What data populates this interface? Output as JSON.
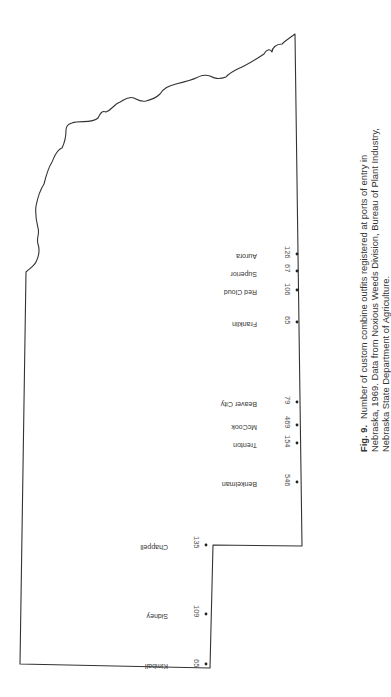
{
  "map": {
    "region": "Nebraska",
    "orientation": "rotated 90 degrees",
    "stroke_color": "#333333",
    "places": [
      {
        "name": "Aurora",
        "count": "126"
      },
      {
        "name": "Superior",
        "count": "67"
      },
      {
        "name": "Red Cloud",
        "count": "106"
      },
      {
        "name": "Franklin",
        "count": "65"
      },
      {
        "name": "Beaver City",
        "count": "79"
      },
      {
        "name": "McCook",
        "count": "469"
      },
      {
        "name": "Trenton",
        "count": "154"
      },
      {
        "name": "Benkelman",
        "count": "546"
      },
      {
        "name": "Chappell",
        "count": "135"
      },
      {
        "name": "Sidney",
        "count": "109"
      },
      {
        "name": "Kimball",
        "count": "65"
      }
    ]
  },
  "caption": {
    "figure_label": "Fig. 9.",
    "text": "Number of custom combine outfits registered at ports of entry in Nebraska, 1969. Data from Noxious Weeds Division, Bureau of Plant Industry, Nebraska State Department of Agriculture."
  }
}
